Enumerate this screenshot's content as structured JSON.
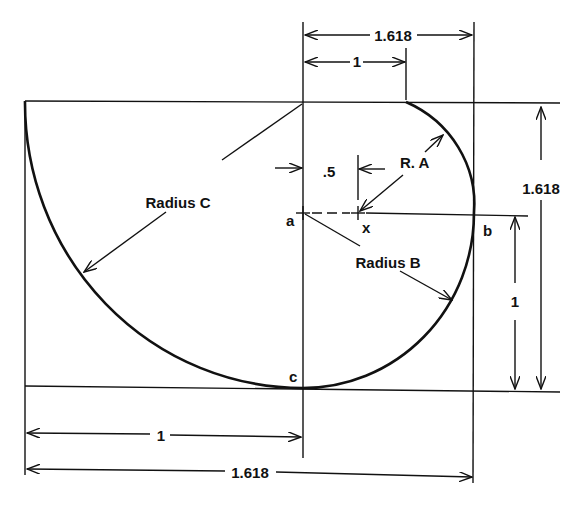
{
  "diagram": {
    "labels": {
      "top_outer_dim": "1.618",
      "top_inner_dim": "1",
      "half_dim": ".5",
      "radius_a": "R. A",
      "radius_b": "Radius B",
      "radius_c": "Radius C",
      "right_outer_dim": "1.618",
      "right_inner_dim": "1",
      "bottom_inner_dim": "1",
      "bottom_outer_dim": "1.618",
      "point_a": "a",
      "point_x": "x",
      "point_b": "b",
      "point_c": "c"
    },
    "colors": {
      "ink": "#111111",
      "background": "#ffffff"
    }
  }
}
